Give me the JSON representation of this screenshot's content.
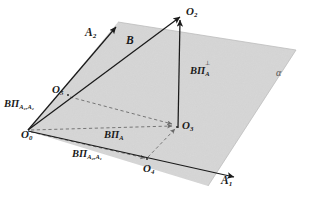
{
  "figure": {
    "plane_label": "α",
    "colors": {
      "plane_fill": "#d4d4d4",
      "stroke": "#1a1a1a",
      "dashed": "#6b6b6b",
      "background": "#ffffff"
    }
  },
  "points": [
    {
      "name": "origin",
      "label_base": "O",
      "label_sub": "0",
      "x": 28,
      "y": 130
    },
    {
      "name": "vector-b-tip",
      "label_base": "O",
      "label_sub": "2",
      "x": 182,
      "y": 14
    },
    {
      "name": "projection-foot",
      "label_base": "O",
      "label_sub": "3",
      "x": 178,
      "y": 128
    },
    {
      "name": "a1-component",
      "label_base": "O",
      "label_sub": "4",
      "x": 148,
      "y": 160
    },
    {
      "name": "a2-component",
      "label_base": "O",
      "label_sub": "5",
      "x": 67,
      "y": 93
    }
  ],
  "vectors": [
    {
      "name": "axis-a2",
      "label_base": "A",
      "label_sub": "2",
      "label_sup": ""
    },
    {
      "name": "axis-a1",
      "label_base": "A",
      "label_sub": "1",
      "label_sup": ""
    },
    {
      "name": "vector-b",
      "label_base": "B",
      "label_sub": "",
      "label_sup": ""
    }
  ],
  "projections": [
    {
      "name": "proj-a1-a2",
      "prefix": "BΠ",
      "sub": "A₁,A₂",
      "sup": ""
    },
    {
      "name": "proj-a2-a1",
      "prefix": "BΠ",
      "sub": "A₂,A₁",
      "sup": ""
    },
    {
      "name": "proj-a",
      "prefix": "BΠ",
      "sub": "A",
      "sup": ""
    },
    {
      "name": "proj-a-perp",
      "prefix": "BΠ",
      "sub": "A",
      "sup": "⊥"
    }
  ],
  "labels": {
    "O0": "O",
    "O0_sub": "0",
    "O2": "O",
    "O2_sub": "2",
    "O3": "O",
    "O3_sub": "3",
    "O4": "O",
    "O4_sub": "4",
    "O5": "O",
    "O5_sub": "5",
    "A1": "A",
    "A1_sub": "1",
    "A2": "A",
    "A2_sub": "2",
    "B": "B",
    "alpha": "α",
    "BPi": "BΠ",
    "sub_a1a2": "A₁,A₂",
    "sub_a2a1": "A₂,A₁",
    "sub_a": "A",
    "sup_perp": "⊥"
  }
}
